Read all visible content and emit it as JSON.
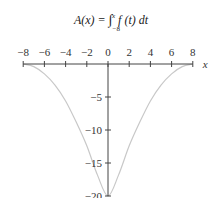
{
  "title_parts": {
    "lhs": "A(x) = ",
    "integral": "∫",
    "upper": "x",
    "lower": "−8",
    "integrand": " f (t) dt"
  },
  "colors": {
    "axis": "#444444",
    "curve": "#c8c8c8",
    "text": "#333333"
  },
  "chart_data": {
    "type": "line",
    "xlabel": "x",
    "ylabel": "",
    "xlim": [
      -8,
      8
    ],
    "ylim": [
      -20,
      0
    ],
    "x_ticks": [
      -8,
      -6,
      -4,
      -2,
      0,
      2,
      4,
      6,
      8
    ],
    "x_tick_labels": [
      "−8",
      "−6",
      "−4",
      "−2",
      "0",
      "2",
      "4",
      "6",
      "8"
    ],
    "y_ticks": [
      -5,
      -10,
      -15,
      -20
    ],
    "y_tick_labels": [
      "−5",
      "−10",
      "−15",
      "−20"
    ],
    "grid": false,
    "legend": null,
    "series": [
      {
        "name": "A(x)",
        "x": [
          -8,
          -7,
          -6,
          -5,
          -4,
          -3,
          -2,
          -1,
          0,
          1,
          2,
          3,
          4,
          5,
          6,
          7,
          8
        ],
        "values": [
          0,
          -0.4,
          -1.5,
          -3.2,
          -5.6,
          -8.8,
          -12.4,
          -16.8,
          -20,
          -16.8,
          -12.4,
          -8.8,
          -5.6,
          -3.2,
          -1.5,
          -0.4,
          0
        ]
      }
    ]
  }
}
